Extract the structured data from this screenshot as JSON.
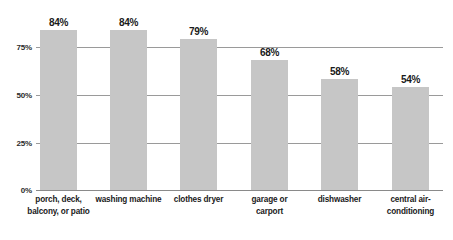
{
  "chart_data": {
    "type": "bar",
    "title": "",
    "subtitle": "",
    "xlabel": "",
    "ylabel": "",
    "ylim": [
      0,
      100
    ],
    "grid": true,
    "legend": false,
    "legend_position": "none",
    "orientation": "vertical",
    "categories": [
      "porch, deck, balcony, or patio",
      "washing machine",
      "clothes dryer",
      "garage or carport",
      "dishwasher",
      "central air-conditioning"
    ],
    "category_lines": [
      [
        "porch, deck,",
        "balcony, or patio"
      ],
      [
        "washing machine"
      ],
      [
        "clothes dryer"
      ],
      [
        "garage or",
        "carport"
      ],
      [
        "dishwasher"
      ],
      [
        "central air-",
        "conditioning"
      ]
    ],
    "values": [
      84,
      84,
      79,
      68,
      58,
      54
    ],
    "value_labels": [
      "84%",
      "84%",
      "79%",
      "68%",
      "58%",
      "54%"
    ],
    "y_ticks": [
      0,
      25,
      50,
      75
    ],
    "y_tick_labels": [
      "0%",
      "25%",
      "50%",
      "75%"
    ],
    "colors": {
      "bar": "#c6c6c6",
      "gridline": "#9a9a9a",
      "baseline": "#8a8a8a",
      "text": "#1a1a1a",
      "tick_text": "#2b2b2b",
      "background": "#ffffff"
    }
  }
}
